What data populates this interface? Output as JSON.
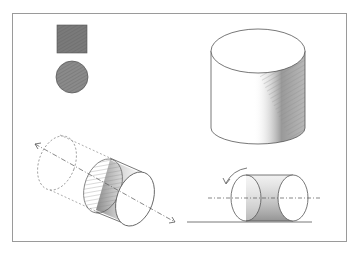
{
  "figure": {
    "elements": [
      {
        "name": "shaded-square",
        "label": "Shaded square"
      },
      {
        "name": "shaded-circle",
        "label": "Shaded circle"
      },
      {
        "name": "upright-cylinder",
        "label": "Upright cylinder with shaded side"
      },
      {
        "name": "tilted-cylinder",
        "label": "Tilted cylinder with dashed axis and ghost outline"
      },
      {
        "name": "rolling-cylinder",
        "label": "Horizontal cylinder with rotation arrow on ground line"
      }
    ],
    "colors": {
      "frame": "#9a9a9a",
      "line": "#555555",
      "shade_dark": "#6a6a6a",
      "shade_mid": "#9a9a9a",
      "background": "#ffffff"
    }
  }
}
